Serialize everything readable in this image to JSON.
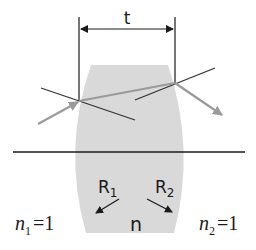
{
  "diagram": {
    "thickness_label": "t",
    "lens_index_label": "n",
    "radius_left_label": "R",
    "radius_left_sub": "1",
    "radius_right_label": "R",
    "radius_right_sub": "2",
    "medium_left": {
      "symbol": "n",
      "sub": "1",
      "eq": "=1"
    },
    "medium_right": {
      "symbol": "n",
      "sub": "2",
      "eq": "=1"
    },
    "colors": {
      "lens_fill": "#d9d9d9",
      "ray": "#9a9a9a",
      "line": "#333333",
      "axis": "#1a1a1a"
    }
  }
}
